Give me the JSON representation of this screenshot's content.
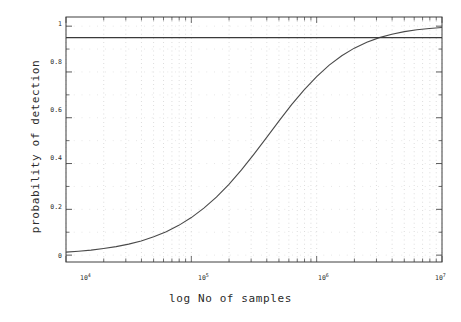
{
  "chart_data": {
    "type": "line",
    "title": "",
    "xlabel": "log No of samples",
    "ylabel": "probability of detection",
    "xscale": "log",
    "xlim": [
      10000,
      10000000
    ],
    "ylim": [
      -0.03,
      1.04
    ],
    "grid": true,
    "grid_style": "dotted",
    "legend": "none",
    "xticks": [
      {
        "value": 10000,
        "label": "10",
        "exp": "4"
      },
      {
        "value": 100000,
        "label": "10",
        "exp": "5"
      },
      {
        "value": 1000000,
        "label": "10",
        "exp": "6"
      },
      {
        "value": 10000000,
        "label": "10",
        "exp": "7"
      }
    ],
    "yticks": [
      "0",
      "0.2",
      "0.4",
      "0.6",
      "0.8",
      "1"
    ],
    "ytick_values": [
      0,
      0.2,
      0.4,
      0.6,
      0.8,
      1
    ],
    "series": [
      {
        "name": "probability of detection",
        "type": "line",
        "color": "#4a4a4a",
        "x": [
          10000,
          12589,
          15849,
          19953,
          25119,
          31623,
          39811,
          50119,
          63096,
          79433,
          100000,
          125893,
          158489,
          199526,
          251189,
          316228,
          398107,
          501187,
          630957,
          794328,
          1000000,
          1258925,
          1584893,
          1995262,
          2511886,
          3162278,
          3981072,
          5011872,
          6309573,
          7943282,
          10000000
        ],
        "y": [
          0.013,
          0.017,
          0.022,
          0.029,
          0.037,
          0.048,
          0.062,
          0.08,
          0.102,
          0.13,
          0.164,
          0.205,
          0.253,
          0.309,
          0.372,
          0.441,
          0.513,
          0.586,
          0.657,
          0.722,
          0.78,
          0.83,
          0.871,
          0.904,
          0.93,
          0.95,
          0.965,
          0.976,
          0.984,
          0.99,
          0.994
        ]
      },
      {
        "name": "reference level",
        "type": "hline",
        "color": "#3a3a3a",
        "y": 0.95
      }
    ]
  },
  "axes": {
    "x_title": "log No of samples",
    "y_title": "probability of detection"
  }
}
